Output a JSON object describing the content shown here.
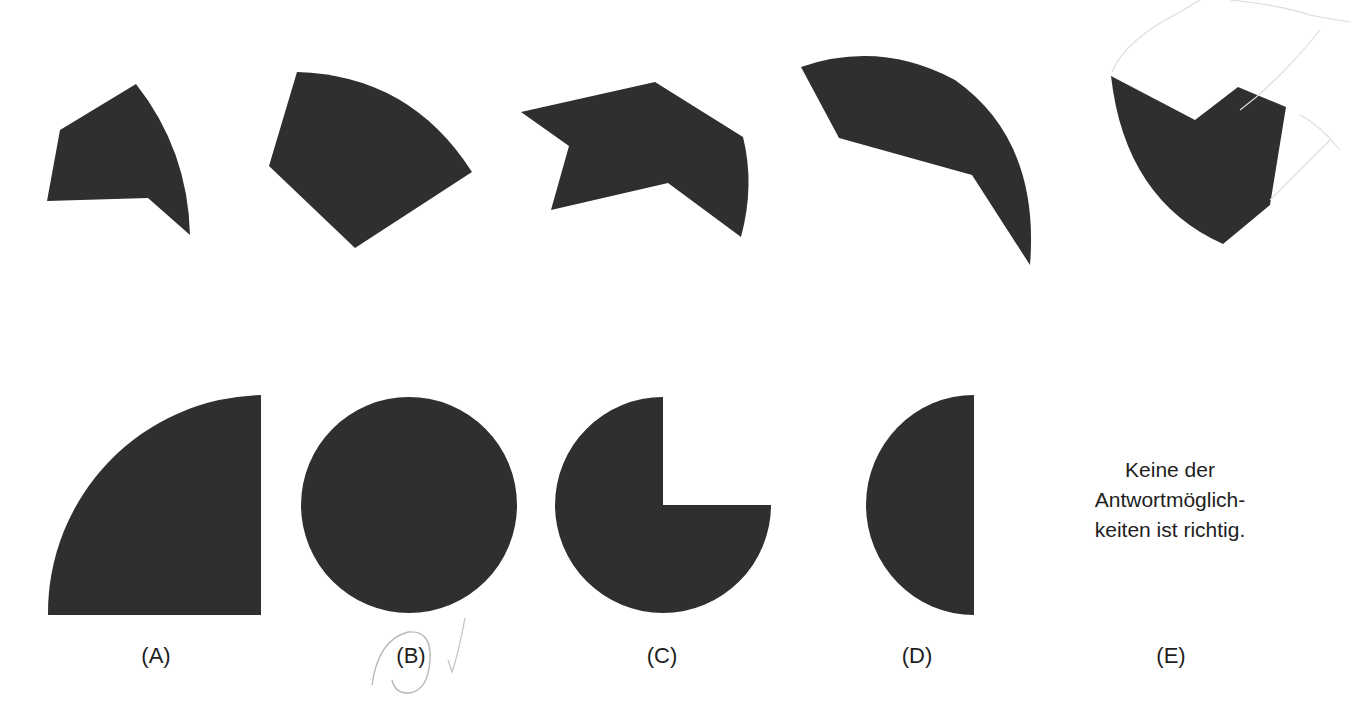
{
  "puzzle": {
    "pieces_count": 5,
    "fill_color": "#2f2f2f",
    "background_color": "#ffffff",
    "pieces": [
      {
        "id": "piece-1",
        "description": "pentagonal piece with curved right edge"
      },
      {
        "id": "piece-2",
        "description": "fan-shaped sector piece"
      },
      {
        "id": "piece-3",
        "description": "arrow-like piece with curved right edge"
      },
      {
        "id": "piece-4",
        "description": "crescent-like curved piece"
      },
      {
        "id": "piece-5",
        "description": "shield-shaped piece with curved left edge"
      }
    ]
  },
  "options": [
    {
      "label": "(A)",
      "shape": "quarter-circle"
    },
    {
      "label": "(B)",
      "shape": "full-circle",
      "marked": true
    },
    {
      "label": "(C)",
      "shape": "three-quarter-circle"
    },
    {
      "label": "(D)",
      "shape": "half-circle"
    },
    {
      "label": "(E)",
      "shape": "text",
      "text_lines": [
        "Keine der",
        "Antwortmöglich-",
        "keiten ist richtig."
      ]
    }
  ],
  "annotations": {
    "circled_option": "(B)",
    "check_mark": "✓",
    "pen_color": "#b8b8b8"
  }
}
